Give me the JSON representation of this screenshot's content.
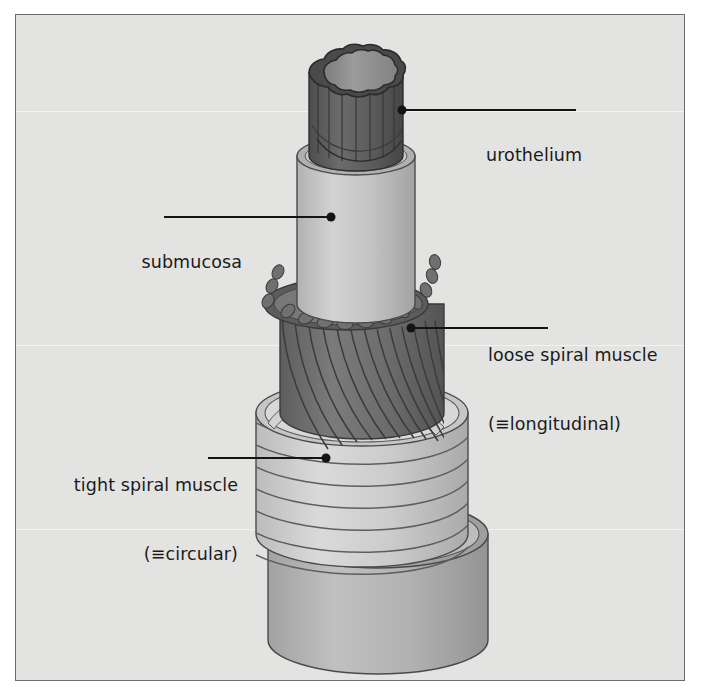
{
  "figure": {
    "background_color": "#e3e3e1",
    "border_color": "#6d6d6d",
    "text_color": "#1b1b1b"
  },
  "labels": [
    {
      "id": "urothelium",
      "line1": "urothelium",
      "line2": "",
      "side": "right",
      "text_x": 470,
      "text_y": 83,
      "dot_x": 386,
      "dot_y": 95,
      "elbow_x": 455,
      "elbow_y": 95
    },
    {
      "id": "submucosa",
      "line1": "submucosa",
      "line2": "",
      "side": "left",
      "text_x": 113,
      "text_y": 190,
      "dot_x": 315,
      "dot_y": 202,
      "elbow_x": 232,
      "elbow_y": 202
    },
    {
      "id": "loose-spiral-muscle",
      "line1": "loose spiral muscle",
      "line2": "(≡longitudinal)",
      "side": "right",
      "text_x": 487,
      "text_y": 283,
      "dot_x": 395,
      "dot_y": 313,
      "elbow_x": 475,
      "elbow_y": 313
    },
    {
      "id": "tight-spiral-muscle",
      "line1": "tight spiral muscle",
      "line2": "(≡circular)",
      "side": "left",
      "text_x": 53,
      "text_y": 413,
      "dot_x": 310,
      "dot_y": 443,
      "elbow_x": 225,
      "elbow_y": 443
    }
  ],
  "layers": [
    {
      "id": "urothelium",
      "name": "urothelium",
      "role": "innermost epithelial lining",
      "fill": "#5a5a5a",
      "rim_fill": "#4a4a4a",
      "lumen_fill": "#8d8d8d",
      "shape": "scalloped star tube with wavy lumen",
      "labeled": true
    },
    {
      "id": "submucosa",
      "name": "submucosa",
      "role": "connective tissue layer",
      "fill": "#c0c0c0",
      "rim_fill": "#b3b3b3",
      "shape": "smooth cylinder",
      "labeled": true
    },
    {
      "id": "loose-spiral-muscle",
      "name": "loose spiral muscle (≡longitudinal)",
      "role": "inner muscular layer, steep spiral",
      "fill": "#6e6e6e",
      "rim_fill": "#616161",
      "fiber_stroke": "#3b3b3b",
      "shape": "steep near-vertical spiral fibres with cut beaded rim",
      "labeled": true
    },
    {
      "id": "tight-spiral-muscle",
      "name": "tight spiral muscle (≡circular)",
      "role": "outer muscular layer, shallow spiral",
      "fill": "#cecece",
      "rim_fill": "#c2c2c2",
      "fiber_stroke": "#5e5e5e",
      "shape": "shallow near-horizontal helical bands",
      "labeled": true
    },
    {
      "id": "adventitia",
      "name": "adventitia",
      "role": "outermost sheath, unlabeled in figure",
      "fill": "#b4b4b4",
      "rim_fill": "#9a9a9a",
      "shape": "plain cylinder",
      "labeled": false
    }
  ]
}
